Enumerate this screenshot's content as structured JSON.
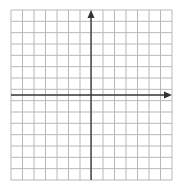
{
  "diagram": {
    "type": "coordinate-plane",
    "grid": {
      "columns": 14,
      "rows": 15,
      "left": 11,
      "top": 10,
      "right": 172,
      "bottom": 180,
      "line_color": "#b8b8b8"
    },
    "axes": {
      "color": "#333333",
      "x_axis_y": 95,
      "y_axis_x": 91,
      "x_arrow": "right",
      "y_arrow": "up"
    },
    "labels": []
  }
}
